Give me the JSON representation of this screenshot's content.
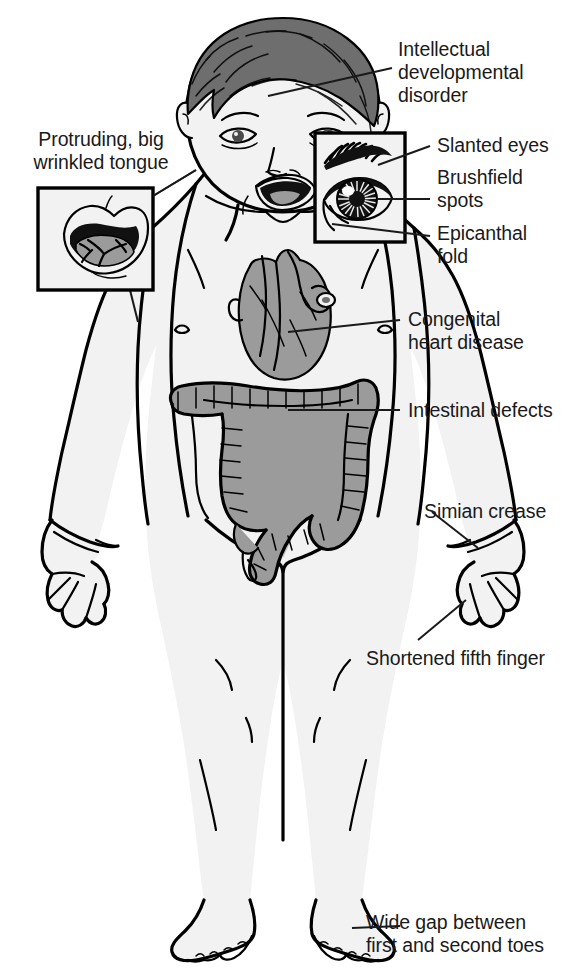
{
  "colors": {
    "outline": "#000000",
    "skin_fill": "#f2f2f2",
    "organ_fill": "#9b9b9b",
    "hair_fill": "#6e6e6e",
    "text": "#1a1a1a",
    "background": "#ffffff",
    "inset_border": "#000000"
  },
  "labels": [
    {
      "id": "intellectual-developmental-disorder",
      "text": "Intellectual\ndevelopmental\ndisorder",
      "side": "right",
      "x": 398,
      "y": 38,
      "target": "head"
    },
    {
      "id": "slanted-eyes",
      "text": "Slanted eyes",
      "side": "right",
      "x": 437,
      "y": 137,
      "target": "eye-inset-upper"
    },
    {
      "id": "brushfield-spots",
      "text": "Brushfield\nspots",
      "side": "right",
      "x": 437,
      "y": 170,
      "target": "eye-inset-iris"
    },
    {
      "id": "epicanthal-fold",
      "text": "Epicanthal\nfold",
      "side": "right",
      "x": 437,
      "y": 226,
      "target": "eye-inset-lower"
    },
    {
      "id": "congenital-heart-disease",
      "text": "Congenital\nheart disease",
      "side": "right",
      "x": 408,
      "y": 310,
      "target": "heart"
    },
    {
      "id": "intestinal-defects",
      "text": "Intestinal defects",
      "side": "right",
      "x": 408,
      "y": 400,
      "target": "colon"
    },
    {
      "id": "simian-crease",
      "text": "Simian crease",
      "side": "right",
      "x": 424,
      "y": 500,
      "target": "left-hand-palm"
    },
    {
      "id": "shortened-fifth-finger",
      "text": "Shortened fifth finger",
      "side": "right",
      "x": 368,
      "y": 647,
      "target": "fifth-finger"
    },
    {
      "id": "wide-gap-toes",
      "text": "Wide gap between\nfirst and second toes",
      "side": "right",
      "x": 368,
      "y": 912,
      "target": "toe-gap"
    },
    {
      "id": "protruding-big-wrinkled-tongue",
      "text": "Protruding, big\nwrinkled tongue",
      "side": "left",
      "x": 18,
      "y": 128,
      "target": "mouth-inset"
    }
  ],
  "insets": [
    {
      "id": "mouth-inset",
      "name": "tongue-detail-inset",
      "x": 38,
      "y": 188,
      "width": 115,
      "height": 102,
      "depicts": "open mouth with large wrinkled protruding tongue"
    },
    {
      "id": "eye-inset",
      "name": "eye-detail-inset",
      "x": 315,
      "y": 133,
      "width": 90,
      "height": 109,
      "depicts": "eye with slanted palpebral fissure, Brushfield spots in iris, epicanthal fold"
    }
  ],
  "anatomy": [
    {
      "id": "head",
      "name": "infant-head"
    },
    {
      "id": "heart",
      "name": "heart-organ"
    },
    {
      "id": "colon",
      "name": "large-intestine-organ"
    },
    {
      "id": "left-hand",
      "name": "left-hand"
    },
    {
      "id": "right-hand",
      "name": "right-hand"
    },
    {
      "id": "feet",
      "name": "feet"
    }
  ]
}
